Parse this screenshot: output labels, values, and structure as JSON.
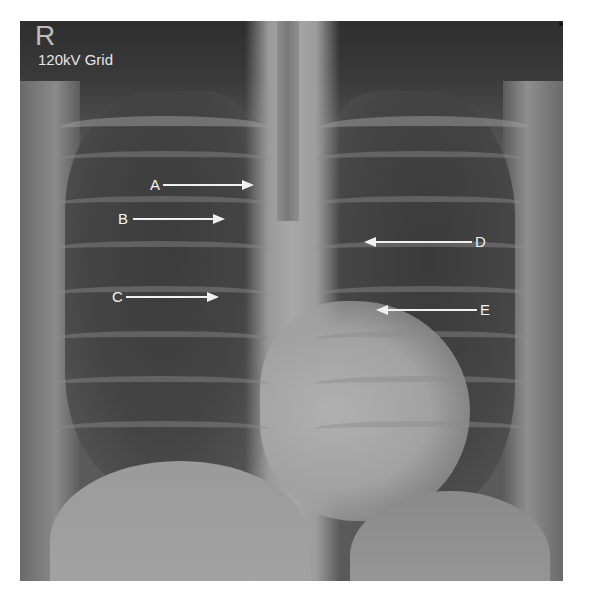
{
  "image": {
    "description": "Frontal (PA) chest radiograph with labeled arrows",
    "side_marker": "R",
    "technique_label": "120kV Grid"
  },
  "annotations": [
    {
      "label": "A",
      "direction": "right",
      "label_x": 150,
      "label_y": 177,
      "arrow_x1": 163,
      "arrow_x2": 252,
      "arrow_y": 184
    },
    {
      "label": "B",
      "direction": "right",
      "label_x": 118,
      "label_y": 211,
      "arrow_x1": 133,
      "arrow_x2": 223,
      "arrow_y": 218
    },
    {
      "label": "C",
      "direction": "right",
      "label_x": 112,
      "label_y": 289,
      "arrow_x1": 126,
      "arrow_x2": 217,
      "arrow_y": 296
    },
    {
      "label": "D",
      "direction": "left",
      "label_x": 475,
      "label_y": 234,
      "arrow_x1": 366,
      "arrow_x2": 472,
      "arrow_y": 241
    },
    {
      "label": "E",
      "direction": "left",
      "label_x": 480,
      "label_y": 302,
      "arrow_x1": 378,
      "arrow_x2": 477,
      "arrow_y": 309
    }
  ]
}
